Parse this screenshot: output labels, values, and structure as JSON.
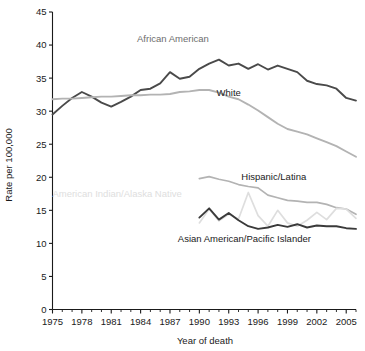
{
  "chart_data": {
    "type": "line",
    "title": "",
    "xlabel": "Year of death",
    "ylabel": "Rate per 100,000",
    "xlim": [
      1975,
      2006
    ],
    "ylim": [
      0,
      45
    ],
    "ytick_step": 5,
    "yticks": [
      "0",
      "5",
      "10",
      "15",
      "20",
      "25",
      "30",
      "35",
      "40",
      "45"
    ],
    "xticks": [
      "1975",
      "1978",
      "1981",
      "1984",
      "1987",
      "1990",
      "1993",
      "1996",
      "1999",
      "2002",
      "2005"
    ],
    "xtick_minor_every": 1,
    "grid": false,
    "legend": "inline-labels",
    "series": [
      {
        "name": "African American",
        "color": "#4a4a4a",
        "width": 1.9,
        "label_x": 1987.3,
        "label_y": 40.4,
        "label_color": "#6d6d6d",
        "x": [
          1975,
          1976,
          1977,
          1978,
          1979,
          1980,
          1981,
          1982,
          1983,
          1984,
          1985,
          1986,
          1987,
          1988,
          1989,
          1990,
          1991,
          1992,
          1993,
          1994,
          1995,
          1996,
          1997,
          1998,
          1999,
          2000,
          2001,
          2002,
          2003,
          2004,
          2005,
          2006
        ],
        "values": [
          29.5,
          30.8,
          32.0,
          32.9,
          32.2,
          31.3,
          30.7,
          31.4,
          32.2,
          33.2,
          33.4,
          34.2,
          35.9,
          34.9,
          35.2,
          36.4,
          37.2,
          37.8,
          36.9,
          37.2,
          36.4,
          37.1,
          36.3,
          36.9,
          36.4,
          35.9,
          34.6,
          34.1,
          33.9,
          33.4,
          32.0,
          31.6
        ]
      },
      {
        "name": "White",
        "color": "#b3b3b3",
        "width": 1.9,
        "label_x": 1993.0,
        "label_y": 32.3,
        "label_color": "#1a1a1a",
        "x": [
          1975,
          1976,
          1977,
          1978,
          1979,
          1980,
          1981,
          1982,
          1983,
          1984,
          1985,
          1986,
          1987,
          1988,
          1989,
          1990,
          1991,
          1992,
          1993,
          1994,
          1995,
          1996,
          1997,
          1998,
          1999,
          2000,
          2001,
          2002,
          2003,
          2004,
          2005,
          2006
        ],
        "values": [
          31.8,
          31.9,
          31.9,
          32.0,
          32.1,
          32.2,
          32.2,
          32.3,
          32.4,
          32.4,
          32.5,
          32.5,
          32.6,
          32.9,
          33.0,
          33.2,
          33.2,
          32.8,
          32.2,
          31.8,
          31.0,
          30.1,
          29.1,
          28.1,
          27.3,
          26.9,
          26.5,
          25.9,
          25.3,
          24.7,
          23.9,
          23.1
        ]
      },
      {
        "name": "Hispanic/Latina",
        "color": "#b3b3b3",
        "width": 1.7,
        "label_x": 1997.6,
        "label_y": 19.6,
        "label_color": "#1a1a1a",
        "x": [
          1990,
          1991,
          1992,
          1993,
          1994,
          1995,
          1996,
          1997,
          1998,
          1999,
          2000,
          2001,
          2002,
          2003,
          2004,
          2005,
          2006
        ],
        "values": [
          19.8,
          20.1,
          19.7,
          19.4,
          18.9,
          18.6,
          18.4,
          17.3,
          16.9,
          16.5,
          16.4,
          16.2,
          16.2,
          15.9,
          15.4,
          15.2,
          14.4
        ]
      },
      {
        "name": "American Indian/Alaska Native",
        "color": "#dedede",
        "width": 1.7,
        "label_x": 1981.6,
        "label_y": 17.0,
        "label_color": "#dedede",
        "x": [
          1990,
          1991,
          1992,
          1993,
          1994,
          1995,
          1996,
          1997,
          1998,
          1999,
          2000,
          2001,
          2002,
          2003,
          2004,
          2005,
          2006
        ],
        "values": [
          13.1,
          15.2,
          13.4,
          14.4,
          13.7,
          17.7,
          14.2,
          12.6,
          15.0,
          13.1,
          12.6,
          13.5,
          14.7,
          13.6,
          15.3,
          15.2,
          13.8
        ]
      },
      {
        "name": "Asian American/Pacific Islander",
        "color": "#3a3a3a",
        "width": 1.9,
        "label_x": 1994.6,
        "label_y": 10.2,
        "label_color": "#1a1a1a",
        "x": [
          1990,
          1991,
          1992,
          1993,
          1994,
          1995,
          1996,
          1997,
          1998,
          1999,
          2000,
          2001,
          2002,
          2003,
          2004,
          2005,
          2006
        ],
        "values": [
          13.9,
          15.3,
          13.6,
          14.6,
          13.5,
          12.6,
          12.2,
          12.4,
          12.8,
          12.5,
          12.9,
          12.4,
          12.7,
          12.6,
          12.6,
          12.3,
          12.2
        ]
      }
    ]
  }
}
